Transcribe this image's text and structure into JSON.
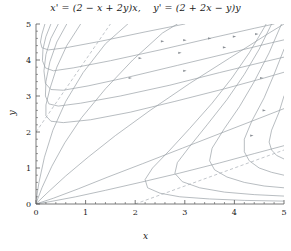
{
  "title": {
    "full": "x' = (2 − x + 2y)x,    y' = (2 + 2x − y)y",
    "part1": "x' = (2 − x + 2y)x,",
    "part2": "y' = (2 + 2x − y)y"
  },
  "chart_data": {
    "type": "line",
    "xlabel": "x",
    "ylabel": "y",
    "xlim": [
      0,
      5
    ],
    "ylim": [
      0,
      5
    ],
    "xticks": [
      0,
      1,
      2,
      3,
      4,
      5
    ],
    "yticks": [
      0,
      1,
      2,
      3,
      4,
      5
    ],
    "xticklabels": [
      "0",
      "1",
      "2",
      "3",
      "4",
      "5"
    ],
    "yticklabels": [
      "0",
      "1",
      "2",
      "3",
      "4",
      "5"
    ],
    "minor_ticks_per_interval": 5,
    "grid": false,
    "legend": null,
    "line_color": "#9aa0a6",
    "nullcline_color": "#a8aeb4",
    "axis_color": "#555555",
    "nullclines": [
      {
        "name": "x-nullcline",
        "equation": "y = 2 + 2x",
        "style": "dashed",
        "points": [
          [
            0,
            2
          ],
          [
            1.5,
            5
          ]
        ]
      },
      {
        "name": "y-nullcline",
        "equation": "x = 2 + 2y",
        "style": "dashed",
        "points": [
          [
            2,
            0
          ],
          [
            5,
            1.5
          ]
        ]
      }
    ],
    "equilibria": [
      [
        0,
        0
      ]
    ],
    "series": [
      {
        "name": "traj-1",
        "arrow_at": 0.55,
        "points": [
          [
            0.02,
            0.005
          ],
          [
            0.3,
            0.07
          ],
          [
            0.8,
            0.2
          ],
          [
            1.4,
            0.38
          ],
          [
            2.1,
            0.6
          ],
          [
            2.9,
            0.86
          ],
          [
            3.7,
            1.14
          ],
          [
            4.4,
            1.4
          ],
          [
            5,
            1.62
          ]
        ]
      },
      {
        "name": "traj-2",
        "arrow_at": 0.55,
        "points": [
          [
            0.02,
            0.01
          ],
          [
            0.35,
            0.16
          ],
          [
            0.85,
            0.42
          ],
          [
            1.45,
            0.75
          ],
          [
            2.15,
            1.12
          ],
          [
            2.95,
            1.55
          ],
          [
            3.75,
            1.98
          ],
          [
            4.5,
            2.38
          ],
          [
            5,
            2.65
          ]
        ]
      },
      {
        "name": "traj-3",
        "arrow_at": 0.55,
        "points": [
          [
            0.01,
            0.02
          ],
          [
            0.22,
            0.3
          ],
          [
            0.6,
            0.78
          ],
          [
            1.05,
            1.3
          ],
          [
            1.6,
            1.9
          ],
          [
            2.3,
            2.6
          ],
          [
            3.1,
            3.35
          ],
          [
            3.9,
            4.05
          ],
          [
            4.7,
            4.75
          ],
          [
            5,
            5
          ]
        ]
      },
      {
        "name": "traj-4",
        "arrow_at": 0.5,
        "points": [
          [
            0.01,
            0.05
          ],
          [
            0.12,
            0.45
          ],
          [
            0.32,
            1.05
          ],
          [
            0.58,
            1.7
          ],
          [
            0.92,
            2.4
          ],
          [
            1.4,
            3.2
          ],
          [
            1.95,
            4.0
          ],
          [
            2.55,
            4.75
          ],
          [
            2.85,
            5
          ]
        ]
      },
      {
        "name": "traj-5",
        "arrow_at": 0.5,
        "points": [
          [
            0.005,
            0.12
          ],
          [
            0.06,
            0.6
          ],
          [
            0.17,
            1.3
          ],
          [
            0.34,
            2.05
          ],
          [
            0.6,
            2.85
          ],
          [
            0.95,
            3.65
          ],
          [
            1.4,
            4.45
          ],
          [
            1.85,
            5
          ]
        ]
      },
      {
        "name": "traj-6",
        "arrow_at": 0.45,
        "points": [
          [
            0.9,
            5
          ],
          [
            0.62,
            4.4
          ],
          [
            0.42,
            3.8
          ],
          [
            0.28,
            3.2
          ],
          [
            0.2,
            2.75
          ],
          [
            0.2,
            2.45
          ],
          [
            0.3,
            2.3
          ],
          [
            0.55,
            2.26
          ],
          [
            1.1,
            2.34
          ],
          [
            1.9,
            2.55
          ],
          [
            2.8,
            2.85
          ],
          [
            3.8,
            3.2
          ],
          [
            4.6,
            3.5
          ],
          [
            5,
            3.66
          ]
        ]
      },
      {
        "name": "traj-7",
        "arrow_at": 0.45,
        "points": [
          [
            0.62,
            5
          ],
          [
            0.42,
            4.5
          ],
          [
            0.28,
            3.95
          ],
          [
            0.2,
            3.4
          ],
          [
            0.19,
            3.0
          ],
          [
            0.26,
            2.78
          ],
          [
            0.45,
            2.72
          ],
          [
            0.9,
            2.8
          ],
          [
            1.7,
            3.0
          ],
          [
            2.7,
            3.3
          ],
          [
            3.7,
            3.65
          ],
          [
            4.6,
            3.95
          ],
          [
            5,
            4.08
          ]
        ]
      },
      {
        "name": "traj-8",
        "arrow_at": 0.45,
        "points": [
          [
            0.45,
            5
          ],
          [
            0.3,
            4.6
          ],
          [
            0.2,
            4.15
          ],
          [
            0.16,
            3.7
          ],
          [
            0.19,
            3.35
          ],
          [
            0.3,
            3.18
          ],
          [
            0.55,
            3.16
          ],
          [
            1.05,
            3.28
          ],
          [
            1.85,
            3.52
          ],
          [
            2.85,
            3.85
          ],
          [
            3.85,
            4.18
          ],
          [
            4.75,
            4.48
          ],
          [
            5,
            4.56
          ]
        ]
      },
      {
        "name": "traj-9",
        "arrow_at": 0.45,
        "points": [
          [
            0.3,
            5
          ],
          [
            0.2,
            4.65
          ],
          [
            0.14,
            4.3
          ],
          [
            0.13,
            3.98
          ],
          [
            0.19,
            3.78
          ],
          [
            0.35,
            3.7
          ],
          [
            0.75,
            3.78
          ],
          [
            1.5,
            3.98
          ],
          [
            2.5,
            4.28
          ],
          [
            3.5,
            4.6
          ],
          [
            4.4,
            4.88
          ],
          [
            4.8,
            5
          ]
        ]
      },
      {
        "name": "traj-10",
        "arrow_at": 0.45,
        "points": [
          [
            0.18,
            5
          ],
          [
            0.12,
            4.72
          ],
          [
            0.09,
            4.5
          ],
          [
            0.12,
            4.34
          ],
          [
            0.25,
            4.28
          ],
          [
            0.6,
            4.34
          ],
          [
            1.3,
            4.52
          ],
          [
            2.2,
            4.78
          ],
          [
            3.0,
            5
          ]
        ]
      },
      {
        "name": "traj-11",
        "arrow_at": 0.5,
        "points": [
          [
            5,
            0.08
          ],
          [
            4.2,
            0.1
          ],
          [
            3.5,
            0.14
          ],
          [
            2.9,
            0.2
          ],
          [
            2.5,
            0.3
          ],
          [
            2.25,
            0.45
          ],
          [
            2.2,
            0.68
          ],
          [
            2.35,
            1.0
          ],
          [
            2.7,
            1.5
          ],
          [
            3.1,
            2.1
          ],
          [
            3.55,
            2.8
          ],
          [
            3.95,
            3.5
          ],
          [
            4.3,
            4.2
          ],
          [
            4.6,
            4.9
          ],
          [
            4.64,
            5
          ]
        ]
      },
      {
        "name": "traj-12",
        "arrow_at": 0.5,
        "points": [
          [
            5,
            0.22
          ],
          [
            4.4,
            0.26
          ],
          [
            3.8,
            0.33
          ],
          [
            3.3,
            0.45
          ],
          [
            2.95,
            0.62
          ],
          [
            2.8,
            0.85
          ],
          [
            2.85,
            1.15
          ],
          [
            3.1,
            1.6
          ],
          [
            3.45,
            2.2
          ],
          [
            3.85,
            2.9
          ],
          [
            4.2,
            3.6
          ],
          [
            4.5,
            4.3
          ],
          [
            4.75,
            5
          ]
        ]
      },
      {
        "name": "traj-13",
        "arrow_at": 0.5,
        "points": [
          [
            5,
            0.45
          ],
          [
            4.6,
            0.5
          ],
          [
            4.2,
            0.6
          ],
          [
            3.85,
            0.75
          ],
          [
            3.6,
            0.95
          ],
          [
            3.5,
            1.2
          ],
          [
            3.55,
            1.55
          ],
          [
            3.8,
            2.1
          ],
          [
            4.1,
            2.7
          ],
          [
            4.4,
            3.4
          ],
          [
            4.7,
            4.2
          ],
          [
            4.95,
            5
          ]
        ]
      },
      {
        "name": "traj-14",
        "arrow_at": 0.5,
        "points": [
          [
            5,
            0.8
          ],
          [
            4.75,
            0.88
          ],
          [
            4.5,
            1.0
          ],
          [
            4.3,
            1.2
          ],
          [
            4.2,
            1.45
          ],
          [
            4.2,
            1.8
          ],
          [
            4.35,
            2.3
          ],
          [
            4.6,
            2.95
          ],
          [
            4.8,
            3.6
          ],
          [
            5,
            4.3
          ]
        ]
      },
      {
        "name": "traj-15",
        "arrow_at": 0.5,
        "points": [
          [
            5,
            1.25
          ],
          [
            4.85,
            1.35
          ],
          [
            4.75,
            1.5
          ],
          [
            4.7,
            1.72
          ],
          [
            4.75,
            2.05
          ],
          [
            4.9,
            2.55
          ],
          [
            5,
            3.0
          ]
        ]
      }
    ],
    "arrows": [
      {
        "x": 2.55,
        "y": 4.52
      },
      {
        "x": 3.0,
        "y": 4.55
      },
      {
        "x": 3.5,
        "y": 4.6
      },
      {
        "x": 4.0,
        "y": 4.65
      },
      {
        "x": 4.45,
        "y": 4.72
      },
      {
        "x": 2.1,
        "y": 4.05
      },
      {
        "x": 2.9,
        "y": 4.2
      },
      {
        "x": 3.8,
        "y": 4.35
      },
      {
        "x": 1.9,
        "y": 3.5
      },
      {
        "x": 3.0,
        "y": 3.7
      },
      {
        "x": 4.55,
        "y": 3.5
      },
      {
        "x": 4.6,
        "y": 2.6
      },
      {
        "x": 4.35,
        "y": 1.9
      }
    ]
  },
  "axis": {
    "x_label": "x",
    "y_label": "y"
  }
}
